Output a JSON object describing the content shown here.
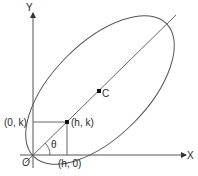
{
  "diagram": {
    "type": "geometry",
    "axes": {
      "x_label": "X",
      "y_label": "Y",
      "origin_label": "O"
    },
    "points": {
      "tangent_x_label": "(h, 0)",
      "tangent_y_label": "(0, k)",
      "focus_point_label": "(h, k)",
      "centre_label": "C"
    },
    "angle_label": "θ",
    "colors": {
      "stroke": "#555555",
      "text": "#2a2a2a",
      "point": "#111111"
    }
  }
}
